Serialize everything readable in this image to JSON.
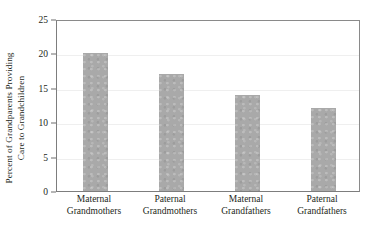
{
  "chart_data": {
    "type": "bar",
    "title": "",
    "xlabel": "",
    "ylabel_line1": "Percent of Grandparents Providing",
    "ylabel_line2": "Care to Grandchildren",
    "categories": [
      "Maternal Grandmothers",
      "Paternal Grandmothers",
      "Maternal Grandfathers",
      "Paternal Grandfathers"
    ],
    "category_lines": [
      {
        "line1": "Maternal",
        "line2": "Grandmothers"
      },
      {
        "line1": "Paternal",
        "line2": "Grandmothers"
      },
      {
        "line1": "Maternal",
        "line2": "Grandfathers"
      },
      {
        "line1": "Paternal",
        "line2": "Grandfathers"
      }
    ],
    "values": [
      20,
      17,
      14,
      12
    ],
    "ylim": [
      0,
      25
    ],
    "ytick_values": [
      0,
      5,
      10,
      15,
      20,
      25
    ],
    "ytick_labels": [
      "0",
      "5",
      "10",
      "15",
      "20",
      "25"
    ],
    "grid": true,
    "grid_axis": "y",
    "legend": false,
    "bar_color": "#a9a9a9",
    "axis_color": "#7d7d7d",
    "grid_color": "#efefef",
    "text_color": "#231f20"
  }
}
